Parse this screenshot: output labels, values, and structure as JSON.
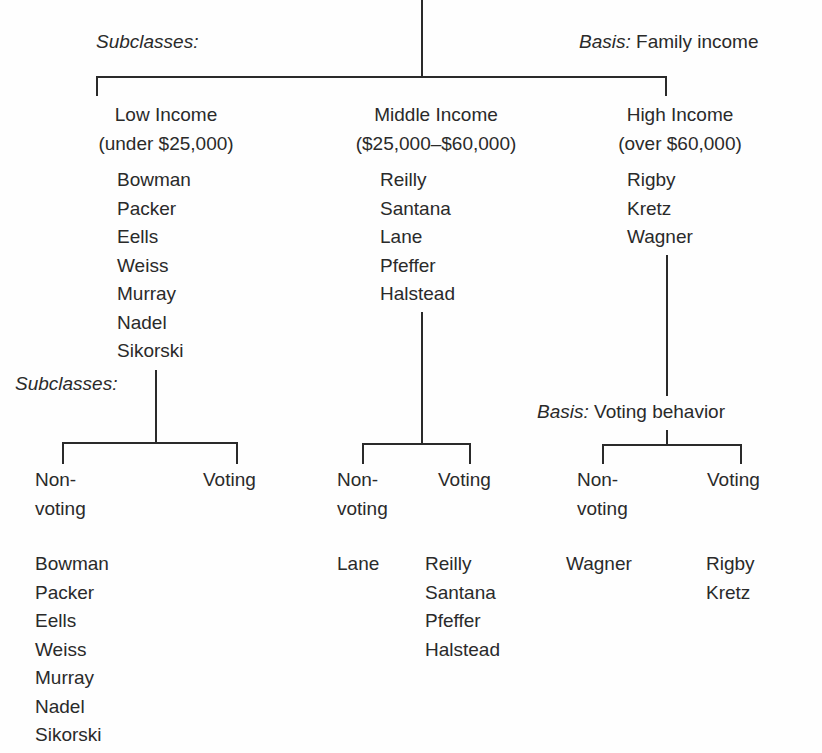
{
  "top_level": {
    "subclasses_label": "Subclasses:",
    "basis_prefix": "Basis:",
    "basis_value": "Family income"
  },
  "classes": [
    {
      "title": "Low Income",
      "range": "(under $25,000)",
      "members": [
        "Bowman",
        "Packer",
        "Eells",
        "Weiss",
        "Murray",
        "Nadel",
        "Sikorski"
      ],
      "sub_label": "Subclasses:",
      "subclasses": [
        {
          "title_line1": "Non-",
          "title_line2": "voting",
          "members": [
            "Bowman",
            "Packer",
            "Eells",
            "Weiss",
            "Murray",
            "Nadel",
            "Sikorski"
          ]
        },
        {
          "title_line1": "Voting",
          "title_line2": "",
          "members": []
        }
      ]
    },
    {
      "title": "Middle Income",
      "range": "($25,000–$60,000)",
      "members": [
        "Reilly",
        "Santana",
        "Lane",
        "Pfeffer",
        "Halstead"
      ],
      "subclasses": [
        {
          "title_line1": "Non-",
          "title_line2": "voting",
          "members": [
            "Lane"
          ]
        },
        {
          "title_line1": "Voting",
          "title_line2": "",
          "members": [
            "Reilly",
            "Santana",
            "Pfeffer",
            "Halstead"
          ]
        }
      ]
    },
    {
      "title": "High Income",
      "range": "(over $60,000)",
      "members": [
        "Rigby",
        "Kretz",
        "Wagner"
      ],
      "basis_prefix": "Basis:",
      "basis_value": "Voting behavior",
      "subclasses": [
        {
          "title_line1": "Non-",
          "title_line2": "voting",
          "members": [
            "Wagner"
          ]
        },
        {
          "title_line1": "Voting",
          "title_line2": "",
          "members": [
            "Rigby",
            "Kretz"
          ]
        }
      ]
    }
  ]
}
